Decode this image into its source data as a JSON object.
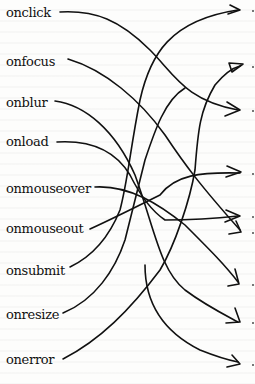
{
  "exercise": {
    "events": [
      {
        "label": "onclick",
        "y": 13
      },
      {
        "label": "onfocus",
        "y": 62
      },
      {
        "label": "onblur",
        "y": 107
      },
      {
        "label": "onload",
        "y": 142
      },
      {
        "label": "onmouseover",
        "y": 189
      },
      {
        "label": "onmouseout",
        "y": 229
      },
      {
        "label": "onsubmit",
        "y": 271
      },
      {
        "label": "onresize",
        "y": 316
      },
      {
        "label": "onerror",
        "y": 360
      }
    ],
    "target_count": 9,
    "line_color": "#111111",
    "background_color": "#fdfdfc"
  }
}
